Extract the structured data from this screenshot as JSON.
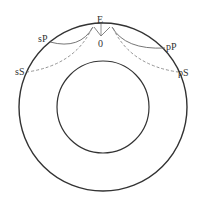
{
  "diagram": {
    "labels": {
      "epicenter": "E",
      "hypocenter": "0",
      "sP": "sP",
      "sS": "sS",
      "pP": "pP",
      "pS": "pS"
    },
    "legend": {
      "solid": "P-wave path (solid)",
      "dashed": "S-wave path (dashed)"
    },
    "colors": {
      "circle": "#333333",
      "p_path": "#666666",
      "s_path": "#888888"
    }
  }
}
